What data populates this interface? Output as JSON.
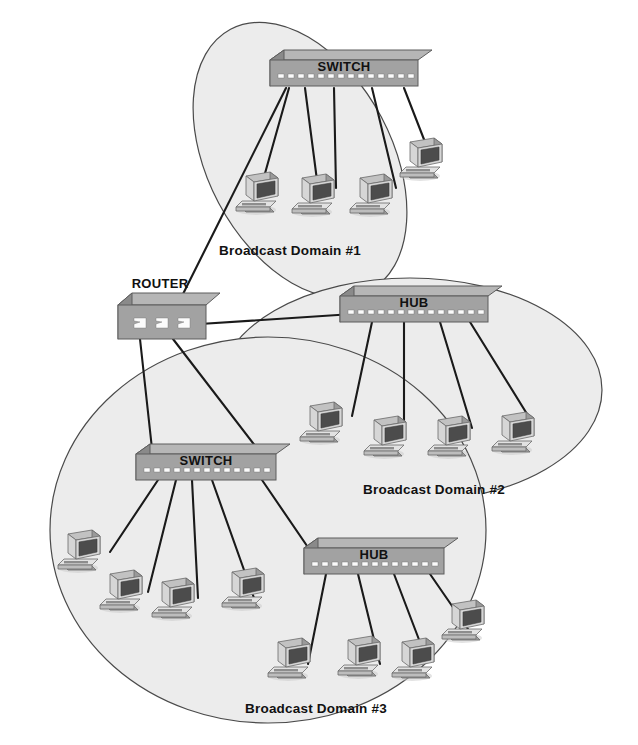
{
  "diagram": {
    "background_color": "#ffffff",
    "domain_fill_color": "#ececec",
    "domain_stroke_color": "#4a4a4a",
    "link_color": "#1a1a1a",
    "device_color": "#a2a2a2"
  },
  "domains": [
    {
      "id": "domain1",
      "label": "Broadcast Domain #1",
      "label_x": 290,
      "label_y": 255,
      "ellipse": {
        "cx": 300,
        "cy": 160,
        "rx": 92,
        "ry": 148,
        "rotate": -28
      },
      "workstation_count": 4
    },
    {
      "id": "domain2",
      "label": "Broadcast Domain #2",
      "label_x": 434,
      "label_y": 494,
      "ellipse": {
        "cx": 410,
        "cy": 390,
        "rx": 192,
        "ry": 112,
        "rotate": 0
      },
      "workstation_count": 4
    },
    {
      "id": "domain3",
      "label": "Broadcast Domain #3",
      "label_x": 316,
      "label_y": 713,
      "ellipse": {
        "cx": 268,
        "cy": 530,
        "rx": 218,
        "ry": 193,
        "rotate": 0
      },
      "workstation_count": 9
    }
  ],
  "devices": [
    {
      "id": "switch1",
      "type": "switch",
      "label": "SWITCH",
      "x": 270,
      "y": 60,
      "w": 148,
      "h": 26,
      "label_inside": true,
      "domain": "domain1"
    },
    {
      "id": "router",
      "type": "router",
      "label": "ROUTER",
      "x": 118,
      "y": 305,
      "w": 88,
      "h": 34,
      "label_inside": false,
      "label_offset_x": 10,
      "label_offset_y": -10,
      "domain": "core"
    },
    {
      "id": "hub1",
      "type": "hub",
      "label": "HUB",
      "x": 340,
      "y": 296,
      "w": 148,
      "h": 26,
      "label_inside": true,
      "domain": "domain2"
    },
    {
      "id": "switch2",
      "type": "switch",
      "label": "SWITCH",
      "x": 136,
      "y": 454,
      "w": 140,
      "h": 26,
      "label_inside": true,
      "domain": "domain3"
    },
    {
      "id": "hub2",
      "type": "hub",
      "label": "HUB",
      "x": 304,
      "y": 548,
      "w": 140,
      "h": 26,
      "label_inside": true,
      "domain": "domain3"
    }
  ],
  "workstations": [
    {
      "id": "pc1-1",
      "x": 252,
      "y": 178,
      "domain": "domain1"
    },
    {
      "id": "pc1-2",
      "x": 305,
      "y": 176,
      "domain": "domain1"
    },
    {
      "id": "pc1-3",
      "x": 363,
      "y": 178,
      "domain": "domain1"
    },
    {
      "id": "pc1-4",
      "x": 416,
      "y": 142,
      "domain": "domain1"
    },
    {
      "id": "pc2-1",
      "x": 318,
      "y": 412,
      "domain": "domain2"
    },
    {
      "id": "pc2-2",
      "x": 381,
      "y": 426,
      "domain": "domain2"
    },
    {
      "id": "pc2-3",
      "x": 444,
      "y": 426,
      "domain": "domain2"
    },
    {
      "id": "pc2-4",
      "x": 508,
      "y": 422,
      "domain": "domain2"
    },
    {
      "id": "pc3-1",
      "x": 76,
      "y": 540,
      "domain": "domain3"
    },
    {
      "id": "pc3-2",
      "x": 118,
      "y": 580,
      "domain": "domain3"
    },
    {
      "id": "pc3-3",
      "x": 170,
      "y": 588,
      "domain": "domain3"
    },
    {
      "id": "pc3-4",
      "x": 240,
      "y": 578,
      "domain": "domain3"
    },
    {
      "id": "pc3-5",
      "x": 286,
      "y": 646,
      "domain": "domain3"
    },
    {
      "id": "pc3-6",
      "x": 356,
      "y": 644,
      "domain": "domain3"
    },
    {
      "id": "pc3-7",
      "x": 410,
      "y": 646,
      "domain": "domain3"
    },
    {
      "id": "pc3-8",
      "x": 460,
      "y": 610,
      "domain": "domain3"
    }
  ],
  "links": [
    {
      "from": "switch1",
      "to": "pc1-1",
      "x1": 289,
      "y1": 86,
      "x2": 262,
      "y2": 182
    },
    {
      "from": "switch1",
      "to": "pc1-2",
      "x1": 303,
      "y1": 86,
      "x2": 318,
      "y2": 186
    },
    {
      "from": "switch1",
      "to": "pc1-3",
      "x1": 331,
      "y1": 86,
      "x2": 334,
      "y2": 186
    },
    {
      "from": "switch1",
      "to": "pc1-4",
      "x1": 372,
      "y1": 86,
      "x2": 396,
      "y2": 186
    },
    {
      "from": "switch1",
      "to": "pc1-5",
      "x1": 404,
      "y1": 86,
      "x2": 430,
      "y2": 158
    },
    {
      "from": "switch1",
      "to": "router",
      "x1": 286,
      "y1": 86,
      "x2": 168,
      "y2": 322
    },
    {
      "from": "router",
      "to": "hub1",
      "x1": 200,
      "y1": 323,
      "x2": 368,
      "y2": 312
    },
    {
      "from": "hub1",
      "to": "pc2-1",
      "x1": 372,
      "y1": 322,
      "x2": 354,
      "y2": 414
    },
    {
      "from": "hub1",
      "to": "pc2-2",
      "x1": 404,
      "y1": 322,
      "x2": 406,
      "y2": 426
    },
    {
      "from": "hub1",
      "to": "pc2-3",
      "x1": 440,
      "y1": 322,
      "x2": 473,
      "y2": 424
    },
    {
      "from": "hub1",
      "to": "pc2-4",
      "x1": 470,
      "y1": 322,
      "x2": 532,
      "y2": 420
    },
    {
      "from": "router",
      "to": "switch2",
      "x1": 140,
      "y1": 339,
      "x2": 152,
      "y2": 460
    },
    {
      "from": "router",
      "to": "hub2-path",
      "x1": 172,
      "y1": 339,
      "x2": 262,
      "y2": 462
    },
    {
      "from": "switch2",
      "to": "pc3-1",
      "x1": 158,
      "y1": 480,
      "x2": 108,
      "y2": 550
    },
    {
      "from": "switch2",
      "to": "pc3-2",
      "x1": 176,
      "y1": 480,
      "x2": 146,
      "y2": 590
    },
    {
      "from": "switch2",
      "to": "pc3-3",
      "x1": 192,
      "y1": 480,
      "x2": 196,
      "y2": 596
    },
    {
      "from": "switch2",
      "to": "pc3-4",
      "x1": 212,
      "y1": 480,
      "x2": 252,
      "y2": 596
    },
    {
      "from": "switch2",
      "to": "hub2",
      "x1": 262,
      "y1": 480,
      "x2": 314,
      "y2": 560
    },
    {
      "from": "hub2",
      "to": "pc3-5",
      "x1": 324,
      "y1": 574,
      "x2": 306,
      "y2": 662
    },
    {
      "from": "hub2",
      "to": "pc3-6",
      "x1": 356,
      "y1": 574,
      "x2": 378,
      "y2": 662
    },
    {
      "from": "hub2",
      "to": "pc3-7",
      "x1": 394,
      "y1": 574,
      "x2": 424,
      "y2": 656
    },
    {
      "from": "hub2",
      "to": "pc3-8",
      "x1": 430,
      "y1": 574,
      "x2": 468,
      "y2": 630
    }
  ]
}
